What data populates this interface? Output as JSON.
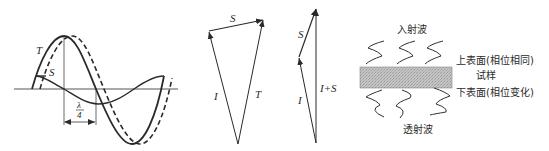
{
  "panels": {
    "waves": {
      "label_T": "T",
      "label_S": "S",
      "label_lambda_num": "λ",
      "label_lambda_den": "4"
    },
    "vector_triangle": {
      "label_S": "S",
      "label_I": "I",
      "label_T": "T"
    },
    "vector_sum": {
      "label_S": "S",
      "label_I": "I",
      "label_IS": "I+S"
    },
    "sample": {
      "incident": "入射波",
      "top_surface": "上表面(相位相同)",
      "sample": "试样",
      "bottom_surface": "下表面(相位变化)",
      "transmitted": "透射波"
    }
  },
  "colors": {
    "line": "#2a2a2a",
    "sample_fill": "#b8b8b8"
  }
}
